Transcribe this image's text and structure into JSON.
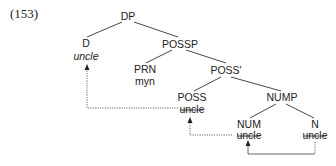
{
  "example": {
    "number": "(153)"
  },
  "tree": {
    "nodes": {
      "dp": "DP",
      "d": "D",
      "d_word": "uncle",
      "possp": "POSSP",
      "prn": "PRN",
      "prn_word": "myn",
      "poss_bar": "POSS'",
      "poss": "POSS",
      "poss_word": "uncle",
      "nump": "NUMP",
      "num": "NUM",
      "num_word": "uncle",
      "n": "N",
      "n_word": "uncle"
    },
    "movement": [
      {
        "from": "N",
        "to": "NUM",
        "style": "dotted/solid"
      },
      {
        "from": "NUM",
        "to": "POSS",
        "style": "dotted"
      },
      {
        "from": "POSS",
        "to": "D",
        "style": "dotted"
      }
    ],
    "struck_words": [
      "POSS uncle",
      "NUM uncle",
      "N uncle"
    ],
    "pronounced_word": "D uncle (italic)"
  }
}
